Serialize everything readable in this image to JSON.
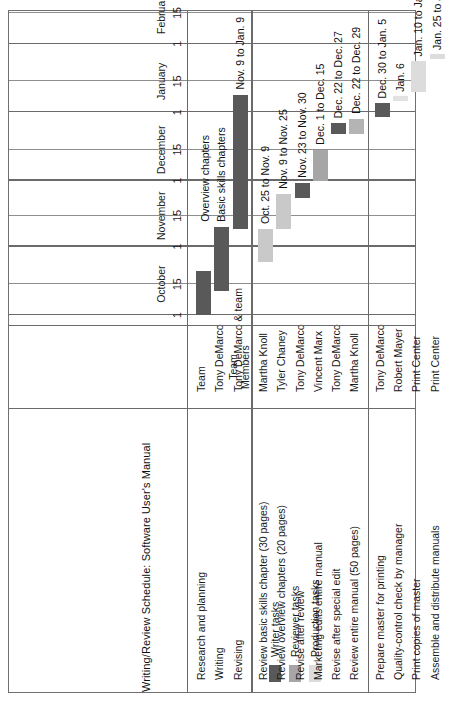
{
  "chart_data": {
    "type": "bar",
    "subtype": "gantt",
    "title": "Writing/Review Schedule: Software User's Manual",
    "orientation": "rotated-90-ccw",
    "xlabel": "",
    "ylabel": "",
    "grid": true,
    "axis": {
      "months": [
        "October",
        "November",
        "December",
        "January",
        "February"
      ],
      "ticks": [
        "1",
        "15",
        "1",
        "15",
        "1",
        "15",
        "1",
        "15",
        "1",
        "15"
      ],
      "range_start": "Oct. 1",
      "range_end": "Feb. 15"
    },
    "legend": {
      "position": "bottom-left",
      "entries": [
        {
          "label": "Writer tasks",
          "color": "#595959"
        },
        {
          "label": "Reviewer tasks",
          "color": "#a6a6a6"
        },
        {
          "label": "Production tasks",
          "color": "#dcdcdc"
        }
      ]
    },
    "columns": [
      "Task",
      "Team Members",
      "Schedule"
    ],
    "column_header_members": "Team\nMembers",
    "groups": [
      {
        "name": "writing",
        "tasks": [
          {
            "task": "Research and planning",
            "member": "Team",
            "label": "",
            "category": "Writer tasks",
            "color": "#595959",
            "start": "Oct. 1",
            "end": "Oct. 21",
            "start_day": 0,
            "end_day": 20
          },
          {
            "task": "Writing",
            "member": "Tony DeMarco",
            "label": "Basic skills chapters",
            "label2": "Overview chapters",
            "category": "Writer tasks",
            "color": "#595959",
            "start": "Oct. 12",
            "end": "Nov. 10",
            "start_day": 11,
            "end_day": 40
          },
          {
            "task": "Revising",
            "member": "Tony DeMarco & team",
            "label": "Nov. 9 to Jan. 9",
            "category": "Writer tasks",
            "color": "#595959",
            "start": "Nov. 9",
            "end": "Jan. 9",
            "start_day": 39,
            "end_day": 100
          }
        ]
      },
      {
        "name": "review",
        "tasks": [
          {
            "task": "Review basic skills chapter (30 pages)",
            "member": "Martha Knoll",
            "label": "Oct. 25 to Nov. 9",
            "category": "Reviewer tasks",
            "color": "#c9c9c9",
            "start": "Oct. 25",
            "end": "Nov. 9",
            "start_day": 24,
            "end_day": 39
          },
          {
            "task": "Review overview chapters (20 pages)",
            "member": "Tyler Chaney",
            "label": "Nov. 9 to Nov. 25",
            "category": "Reviewer tasks",
            "color": "#c9c9c9",
            "start": "Nov. 9",
            "end": "Nov. 25",
            "start_day": 39,
            "end_day": 55
          },
          {
            "task": "Revise after review",
            "member": "Tony DeMarco",
            "label": "Nov. 23 to Nov. 30",
            "category": "Writer tasks",
            "color": "#595959",
            "start": "Nov. 23",
            "end": "Nov. 30",
            "start_day": 53,
            "end_day": 60
          },
          {
            "task": "Marketing edits entire manual",
            "member": "Vincent Marx",
            "label": "Dec. 1 to Dec. 15",
            "category": "Reviewer tasks",
            "color": "#a6a6a6",
            "start": "Dec. 1",
            "end": "Dec. 15",
            "start_day": 61,
            "end_day": 75
          },
          {
            "task": "Revise after special edit",
            "member": "Tony DeMarco",
            "label": "Dec. 22 to Dec. 27",
            "category": "Writer tasks",
            "color": "#595959",
            "start": "Dec. 22",
            "end": "Dec. 27",
            "start_day": 82,
            "end_day": 87
          },
          {
            "task": "Review entire manual (50 pages)",
            "member": "Martha Knoll",
            "label": "Dec. 22 to Dec. 29",
            "category": "Reviewer tasks",
            "color": "#b4b4b4",
            "start": "Dec. 22",
            "end": "Dec. 29",
            "start_day": 82,
            "end_day": 89
          }
        ]
      },
      {
        "name": "production",
        "tasks": [
          {
            "task": "Prepare master for printing",
            "member": "Tony DeMarco",
            "label": "Dec. 30 to Jan. 5",
            "category": "Writer tasks",
            "color": "#595959",
            "start": "Dec. 30",
            "end": "Jan. 5",
            "start_day": 90,
            "end_day": 96
          },
          {
            "task": "Quality-control check by manager",
            "member": "Robert Mayer",
            "label": "Jan. 6",
            "category": "Production tasks",
            "color": "#e2e2e2",
            "start": "Jan. 6",
            "end": "Jan. 7",
            "start_day": 97,
            "end_day": 99
          },
          {
            "task": "Print copies of master",
            "member": "Print Center",
            "label": "Jan. 10 to Jan. 24",
            "category": "Production tasks",
            "color": "#dcdcdc",
            "start": "Jan. 10",
            "end": "Jan. 24",
            "start_day": 101,
            "end_day": 115
          },
          {
            "task": "Assemble and distribute manuals",
            "member": "Print Center",
            "label": "Jan. 25 to Jan. 27",
            "category": "Production tasks",
            "color": "#dcdcdc",
            "start": "Jan. 25",
            "end": "Jan. 27",
            "start_day": 116,
            "end_day": 118
          }
        ]
      }
    ]
  }
}
